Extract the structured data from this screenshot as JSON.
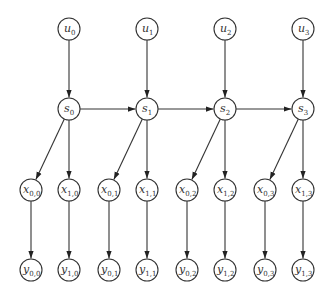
{
  "diagram": {
    "type": "graphical-model",
    "node_radius": 11,
    "nodes": [
      {
        "id": "u0",
        "base": "u",
        "sub": "0",
        "x": 69,
        "y": 29
      },
      {
        "id": "u1",
        "base": "u",
        "sub": "1",
        "x": 147,
        "y": 29
      },
      {
        "id": "u2",
        "base": "u",
        "sub": "2",
        "x": 225,
        "y": 29
      },
      {
        "id": "u3",
        "base": "u",
        "sub": "3",
        "x": 303,
        "y": 29
      },
      {
        "id": "s0",
        "base": "s",
        "sub": "0",
        "x": 69,
        "y": 109
      },
      {
        "id": "s1",
        "base": "s",
        "sub": "1",
        "x": 147,
        "y": 109
      },
      {
        "id": "s2",
        "base": "s",
        "sub": "2",
        "x": 225,
        "y": 109
      },
      {
        "id": "s3",
        "base": "s",
        "sub": "3",
        "x": 303,
        "y": 109
      },
      {
        "id": "x00",
        "base": "x",
        "sub": "0,0",
        "x": 31,
        "y": 190
      },
      {
        "id": "x10",
        "base": "x",
        "sub": "1,0",
        "x": 69,
        "y": 190
      },
      {
        "id": "x01",
        "base": "x",
        "sub": "0,1",
        "x": 109,
        "y": 190
      },
      {
        "id": "x11",
        "base": "x",
        "sub": "1,1",
        "x": 147,
        "y": 190
      },
      {
        "id": "x02",
        "base": "x",
        "sub": "0,2",
        "x": 187,
        "y": 190
      },
      {
        "id": "x12",
        "base": "x",
        "sub": "1,2",
        "x": 225,
        "y": 190
      },
      {
        "id": "x03",
        "base": "x",
        "sub": "0,3",
        "x": 265,
        "y": 190
      },
      {
        "id": "x13",
        "base": "x",
        "sub": "1,3",
        "x": 303,
        "y": 190
      },
      {
        "id": "y00",
        "base": "y",
        "sub": "0,0",
        "x": 31,
        "y": 270
      },
      {
        "id": "y10",
        "base": "y",
        "sub": "1,0",
        "x": 69,
        "y": 270
      },
      {
        "id": "y01",
        "base": "y",
        "sub": "0,1",
        "x": 109,
        "y": 270
      },
      {
        "id": "y11",
        "base": "y",
        "sub": "1,1",
        "x": 147,
        "y": 270
      },
      {
        "id": "y02",
        "base": "y",
        "sub": "0,2",
        "x": 187,
        "y": 270
      },
      {
        "id": "y12",
        "base": "y",
        "sub": "1,2",
        "x": 225,
        "y": 270
      },
      {
        "id": "y03",
        "base": "y",
        "sub": "0,3",
        "x": 265,
        "y": 270
      },
      {
        "id": "y13",
        "base": "y",
        "sub": "1,3",
        "x": 303,
        "y": 270
      }
    ],
    "edges": [
      [
        "u0",
        "s0"
      ],
      [
        "u1",
        "s1"
      ],
      [
        "u2",
        "s2"
      ],
      [
        "u3",
        "s3"
      ],
      [
        "s0",
        "s1"
      ],
      [
        "s1",
        "s2"
      ],
      [
        "s2",
        "s3"
      ],
      [
        "s0",
        "x00"
      ],
      [
        "s0",
        "x10"
      ],
      [
        "s1",
        "x01"
      ],
      [
        "s1",
        "x11"
      ],
      [
        "s2",
        "x02"
      ],
      [
        "s2",
        "x12"
      ],
      [
        "s3",
        "x03"
      ],
      [
        "s3",
        "x13"
      ],
      [
        "x00",
        "y00"
      ],
      [
        "x10",
        "y10"
      ],
      [
        "x01",
        "y01"
      ],
      [
        "x11",
        "y11"
      ],
      [
        "x02",
        "y02"
      ],
      [
        "x12",
        "y12"
      ],
      [
        "x03",
        "y03"
      ],
      [
        "x13",
        "y13"
      ]
    ]
  }
}
